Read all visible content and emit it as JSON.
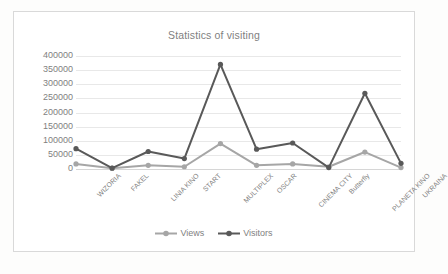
{
  "chart_data": {
    "type": "line",
    "title": "Statistics of visiting",
    "xlabel": "",
    "ylabel": "",
    "ylim": [
      0,
      400000
    ],
    "ytick_step": 50000,
    "yticks": [
      "400000",
      "350000",
      "300000",
      "250000",
      "200000",
      "150000",
      "100000",
      "50000",
      "0"
    ],
    "grid": true,
    "legend_position": "bottom",
    "categories": [
      "WIZORIA",
      "FAKEL",
      "LINIA KINO",
      "START",
      "MULTIPLEX",
      "OSCAR",
      "CINEMA CITY",
      "Butterfly",
      "PLANETA KINO",
      "UKRAINA"
    ],
    "series": [
      {
        "name": "Views",
        "color": "#a6a6a6",
        "values": [
          18000,
          3000,
          13000,
          8000,
          90000,
          13000,
          18000,
          8000,
          60000,
          5000
        ]
      },
      {
        "name": "Visitors",
        "color": "#595959",
        "values": [
          72000,
          3000,
          62000,
          37000,
          370000,
          70000,
          92000,
          5000,
          268000,
          20000
        ]
      }
    ]
  },
  "colors": {
    "frame_border": "#d9d9d9",
    "plot_background": "#ffffff",
    "page_background": "#fdfdfc",
    "gridline": "#e8e8e8",
    "text": "#7f7f7f"
  }
}
